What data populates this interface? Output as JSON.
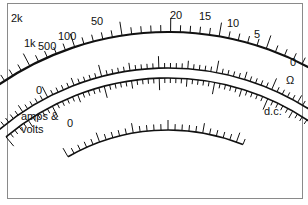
{
  "ohms_scale": {
    "labels": [
      "2k",
      "1k",
      "500",
      "100",
      "50",
      "20",
      "15",
      "10",
      "5",
      "0"
    ],
    "unit": "Ω"
  },
  "dc_scale": {
    "zero_label": "0",
    "left_label_line1": "amps &",
    "left_label_line2": "volts",
    "right_label": "d.c."
  },
  "lower_scale": {
    "zero_label": "0"
  },
  "colors": {
    "ink": "#111111",
    "frame": "#8a8a8a",
    "background": "#ffffff"
  }
}
